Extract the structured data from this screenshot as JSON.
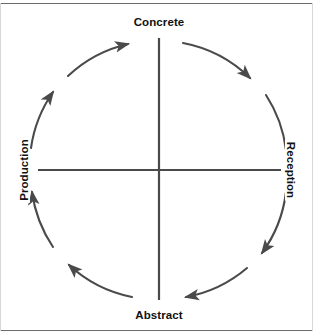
{
  "figure": {
    "type": "cycle-diagram",
    "direction": "clockwise",
    "background_color": "#ffffff",
    "stroke_color": "#4a4a4a",
    "border_color": "#6b6b6b",
    "text_color": "#111111"
  },
  "axes": {
    "vertical": {
      "top_label": "Concrete",
      "bottom_label": "Abstract"
    },
    "horizontal": {
      "left_label": "Production",
      "right_label": "Reception"
    }
  },
  "nodes": [
    {
      "id": "concrete",
      "label": "Concrete",
      "position": "top",
      "rotation": 0
    },
    {
      "id": "reception",
      "label": "Reception",
      "position": "right",
      "rotation": 90
    },
    {
      "id": "abstract",
      "label": "Abstract",
      "position": "bottom",
      "rotation": 0
    },
    {
      "id": "production",
      "label": "Production",
      "position": "left",
      "rotation": -90
    }
  ],
  "arcs": [
    {
      "id": "arc-concrete-to-reception",
      "from": "concrete",
      "to": "reception",
      "quadrant": "top-right",
      "arrowhead": "mid"
    },
    {
      "id": "arc-reception-to-abstract",
      "from": "reception",
      "to": "abstract",
      "quadrant": "bottom-right",
      "arrowhead": "mid"
    },
    {
      "id": "arc-abstract-to-production",
      "from": "abstract",
      "to": "production",
      "quadrant": "bottom-left",
      "arrowhead": "mid"
    },
    {
      "id": "arc-production-to-concrete",
      "from": "production",
      "to": "concrete",
      "quadrant": "top-left",
      "arrowhead": "mid"
    }
  ]
}
